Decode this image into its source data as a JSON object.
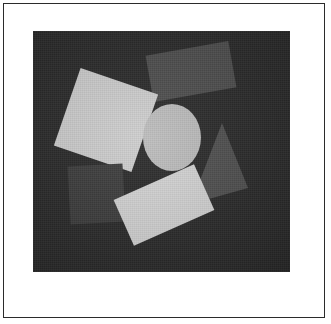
{
  "figure": {
    "canvas_width": 331,
    "canvas_height": 324,
    "background_color": "#ffffff"
  },
  "frame": {
    "name": "outer-rule",
    "border_color": "#2b2b2b",
    "border_width": 1,
    "margin_color": "#ffffff"
  },
  "panel": {
    "name": "image-panel",
    "x": 33,
    "y": 31,
    "width": 257,
    "height": 241,
    "background_color": "#2c2c2c",
    "texture": "fine-grain-noise"
  },
  "shapes": [
    {
      "id": "rect-top-medium",
      "kind": "rectangle",
      "label": "Top medium-gray rectangle",
      "fill": "#4f4f4f",
      "x": 116,
      "y": 17,
      "width": 84,
      "height": 47,
      "rotation": -10
    },
    {
      "id": "square-large-light",
      "kind": "square",
      "label": "Large light-gray rotated square",
      "fill": "#cfcfcf",
      "x": 32,
      "y": 48,
      "width": 82,
      "height": 82,
      "rotation": 19
    },
    {
      "id": "ellipse-center",
      "kind": "ellipse",
      "label": "Center light-gray ellipse",
      "fill": "#bdbdbd",
      "x": 110,
      "y": 73,
      "width": 58,
      "height": 67,
      "rotation": 0
    },
    {
      "id": "triangle-right",
      "kind": "triangle",
      "label": "Right dark-gray triangle",
      "fill": "#515151",
      "apex_x": 189,
      "apex_y": 92,
      "base_left_x": 158,
      "base_left_y": 173,
      "base_right_x": 215,
      "base_right_y": 157,
      "rotation": 0
    },
    {
      "id": "square-lowleft-dark",
      "kind": "square",
      "label": "Lower-left dark-gray square",
      "fill": "#3e3e3e",
      "x": 36,
      "y": 134,
      "width": 55,
      "height": 58,
      "rotation": -3
    },
    {
      "id": "rect-bottom-bright",
      "kind": "rectangle",
      "label": "Bottom bright rotated rectangle",
      "fill": "#d5d5d5",
      "x": 87,
      "y": 149,
      "width": 88,
      "height": 50,
      "rotation": -24
    }
  ],
  "palette": {
    "panel_background": "#2c2c2c",
    "brightest_shape": "#d5d5d5",
    "mid_shape": "#bdbdbd",
    "dark_shape": "#3e3e3e",
    "frame_line": "#2b2b2b",
    "page_white": "#ffffff"
  }
}
